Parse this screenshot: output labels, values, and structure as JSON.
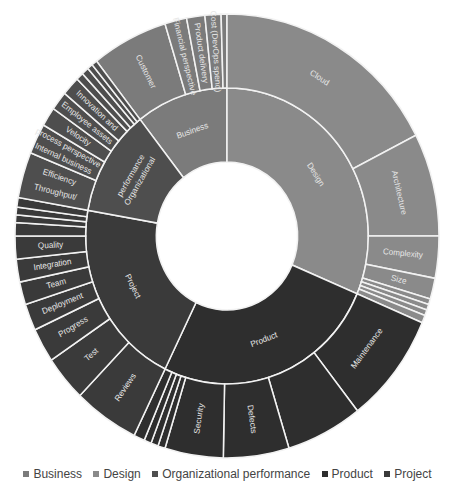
{
  "chart_data": {
    "type": "sunburst",
    "title": "",
    "legend": [
      "Business",
      "Design",
      "Organizational performance",
      "Product",
      "Project"
    ],
    "legend_position": "bottom",
    "colors": {
      "Business": "#7b7b7b",
      "Design": "#8a8a8a",
      "Organizational performance": "#4e4e4e",
      "Product": "#2e2e2e",
      "Project": "#3a3a3a"
    },
    "inner_ring": [
      {
        "name": "Business",
        "start": -38,
        "end": 0
      },
      {
        "name": "Design",
        "start": 0,
        "end": 113
      },
      {
        "name": "Product",
        "start": 113,
        "end": 206
      },
      {
        "name": "Project",
        "start": 206,
        "end": 280
      },
      {
        "name": "Organizational performance",
        "start": 280,
        "end": 322
      }
    ],
    "outer_ring": [
      {
        "parent": "Business",
        "name": "Customer",
        "start": -38,
        "end": -17,
        "label": "Customer"
      },
      {
        "parent": "Business",
        "name": "Financial perspective",
        "start": -17,
        "end": -11,
        "label": "Financial perspective"
      },
      {
        "parent": "Business",
        "name": "Product delivery",
        "start": -11,
        "end": -6,
        "label": "Product delivery"
      },
      {
        "parent": "Business",
        "name": "Cost (DevOps spend)",
        "start": -6,
        "end": -1.6,
        "label": "Cost (DevOps spend)"
      },
      {
        "parent": "Business",
        "name": "",
        "start": -1.6,
        "end": 0,
        "label": ""
      },
      {
        "parent": "Design",
        "name": "Cloud",
        "start": 0,
        "end": 63,
        "label": "Cloud"
      },
      {
        "parent": "Design",
        "name": "Architecture",
        "start": 63,
        "end": 90,
        "label": "Architecture"
      },
      {
        "parent": "Design",
        "name": "Complexity",
        "start": 90,
        "end": 101,
        "label": "Complexity"
      },
      {
        "parent": "Design",
        "name": "Size",
        "start": 101,
        "end": 106.5,
        "label": "Size"
      },
      {
        "parent": "Design",
        "name": "",
        "start": 106.5,
        "end": 108,
        "label": ""
      },
      {
        "parent": "Design",
        "name": "",
        "start": 108,
        "end": 109.5,
        "label": ""
      },
      {
        "parent": "Design",
        "name": "",
        "start": 109.5,
        "end": 111,
        "label": ""
      },
      {
        "parent": "Design",
        "name": "",
        "start": 111,
        "end": 113,
        "label": ""
      },
      {
        "parent": "Product",
        "name": "Maintenance",
        "start": 113,
        "end": 142,
        "label": "Maintenance"
      },
      {
        "parent": "Product",
        "name": "",
        "start": 142,
        "end": 163,
        "label": ""
      },
      {
        "parent": "Product",
        "name": "Defects",
        "start": 163,
        "end": 181,
        "label": "Defects"
      },
      {
        "parent": "Product",
        "name": "Security",
        "start": 181,
        "end": 197,
        "label": "Security"
      },
      {
        "parent": "Product",
        "name": "",
        "start": 197,
        "end": 199,
        "label": ""
      },
      {
        "parent": "Product",
        "name": "",
        "start": 199,
        "end": 201,
        "label": ""
      },
      {
        "parent": "Product",
        "name": "",
        "start": 201,
        "end": 203,
        "label": ""
      },
      {
        "parent": "Product",
        "name": "",
        "start": 203,
        "end": 206,
        "label": ""
      },
      {
        "parent": "Project",
        "name": "Reviews",
        "start": 206,
        "end": 224,
        "label": "Reviews"
      },
      {
        "parent": "Project",
        "name": "Test",
        "start": 224,
        "end": 236,
        "label": "Test"
      },
      {
        "parent": "Project",
        "name": "Progress",
        "start": 236,
        "end": 245,
        "label": "Progress"
      },
      {
        "parent": "Project",
        "name": "Deployment",
        "start": 245,
        "end": 252,
        "label": "Deployment"
      },
      {
        "parent": "Project",
        "name": "Team",
        "start": 252,
        "end": 258,
        "label": "Team"
      },
      {
        "parent": "Project",
        "name": "Integration",
        "start": 258,
        "end": 264,
        "label": "Integration"
      },
      {
        "parent": "Project",
        "name": "Quality",
        "start": 264,
        "end": 270,
        "label": "Quality"
      },
      {
        "parent": "Project",
        "name": "",
        "start": 270,
        "end": 273.5,
        "label": ""
      },
      {
        "parent": "Project",
        "name": "",
        "start": 273.5,
        "end": 275.5,
        "label": ""
      },
      {
        "parent": "Project",
        "name": "",
        "start": 275.5,
        "end": 277.5,
        "label": ""
      },
      {
        "parent": "Project",
        "name": "",
        "start": 277.5,
        "end": 280,
        "label": ""
      },
      {
        "parent": "Organizational performance",
        "name": "Throughput/ Efficiency",
        "start": 280,
        "end": 292,
        "label": "Throughput/ Efficiency"
      },
      {
        "parent": "Organizational performance",
        "name": "Internal business process perspective",
        "start": 292,
        "end": 300,
        "label": "Internal business process perspective"
      },
      {
        "parent": "Organizational performance",
        "name": "Velocity",
        "start": 300,
        "end": 305,
        "label": "Velocity"
      },
      {
        "parent": "Organizational performance",
        "name": "Employee assets",
        "start": 305,
        "end": 310,
        "label": "Employee assets"
      },
      {
        "parent": "Organizational performance",
        "name": "Innovation and...",
        "start": 310,
        "end": 315,
        "label": "Innovation and"
      },
      {
        "parent": "Organizational performance",
        "name": "",
        "start": 315,
        "end": 317,
        "label": ""
      },
      {
        "parent": "Organizational performance",
        "name": "",
        "start": 317,
        "end": 319,
        "label": ""
      },
      {
        "parent": "Organizational performance",
        "name": "",
        "start": 319,
        "end": 320.5,
        "label": ""
      },
      {
        "parent": "Organizational performance",
        "name": "",
        "start": 320.5,
        "end": 322,
        "label": ""
      }
    ],
    "inner_labels": {
      "Business": "Business",
      "Design": "Design",
      "Product": "Product",
      "Project": "Project",
      "Organizational performance": "Organizational performance"
    }
  },
  "legend": {
    "items": [
      {
        "label": "Business",
        "color": "#7b7b7b"
      },
      {
        "label": "Design",
        "color": "#8a8a8a"
      },
      {
        "label": "Organizational performance",
        "color": "#4e4e4e"
      },
      {
        "label": "Product",
        "color": "#2e2e2e"
      },
      {
        "label": "Project",
        "color": "#3a3a3a"
      }
    ]
  }
}
